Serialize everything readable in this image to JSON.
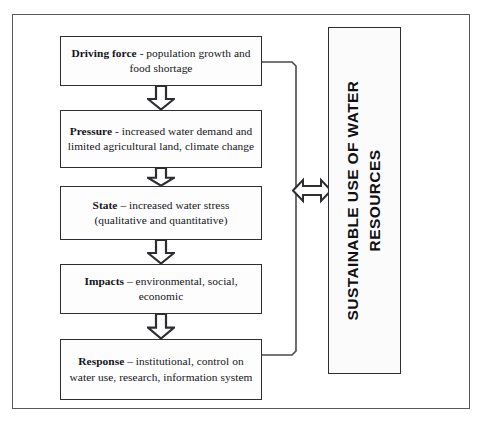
{
  "diagram": {
    "frame": {
      "border_color": "#58585c"
    },
    "flow_boxes": [
      {
        "id": "driving-force",
        "lead": "Driving force",
        "rest": " - population growth and food shortage",
        "full_text": "Driving force - population growth and food shortage"
      },
      {
        "id": "pressure",
        "lead": "Pressure",
        "rest": " - increased  water demand  and limited agricultural land, climate change",
        "full_text": "Pressure - increased  water demand  and limited agricultural land, climate change"
      },
      {
        "id": "state",
        "lead": "State",
        "rest": " – increased water stress (qualitative and  quantitative)",
        "full_text": "State – increased water stress (qualitative and  quantitative)"
      },
      {
        "id": "impacts",
        "lead": "Impacts",
        "rest": " – environmental, social, economic",
        "full_text": "Impacts – environmental, social, economic"
      },
      {
        "id": "response",
        "lead": "Response",
        "rest": " – institutional, control on water  use, research, information system",
        "full_text": "Response – institutional, control on water  use, research, information system"
      }
    ],
    "banner": {
      "id": "sustainable-use-of-water-resources",
      "text": "SUSTAINABLE USE OF WATER RESOURCES",
      "orientation": "vertical-bottom-to-top",
      "text_color": "#101014"
    },
    "connectors": {
      "down_arrows": {
        "count": 4,
        "style": "hollow-block-arrow",
        "direction": "down"
      },
      "bracket": {
        "from": "driving-force",
        "to": "response",
        "style": "right-side-bracket-line",
        "color": "#4a4a4e"
      },
      "double_arrow": {
        "style": "hollow-double-headed-arrow",
        "direction": "left-right",
        "links": [
          "flow-chain",
          "sustainable-use-of-water-resources"
        ]
      }
    }
  }
}
